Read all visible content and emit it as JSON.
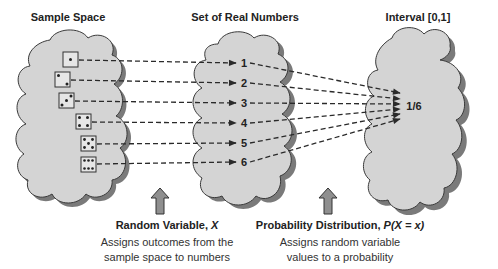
{
  "titles": {
    "sample_space": "Sample Space",
    "real_numbers": "Set of Real Numbers",
    "interval": "Interval [0,1]"
  },
  "sample_space": {
    "outcomes": [
      {
        "die_face": 1
      },
      {
        "die_face": 2
      },
      {
        "die_face": 3
      },
      {
        "die_face": 4
      },
      {
        "die_face": 5
      },
      {
        "die_face": 6
      }
    ]
  },
  "real_numbers": {
    "values": [
      "1",
      "2",
      "3",
      "4",
      "5",
      "6"
    ]
  },
  "interval": {
    "probability": "1/6"
  },
  "captions": {
    "random_variable": {
      "heading_prefix": "Random Variable, ",
      "heading_symbol": "X",
      "line1": "Assigns outcomes from the",
      "line2": "sample space to numbers"
    },
    "probability_distribution": {
      "heading_prefix": "Probability Distribution, ",
      "heading_symbol": "P(X = x)",
      "line1": "Assigns random variable",
      "line2": "values to a probability"
    }
  },
  "colors": {
    "cloud_fill": "#d4d4d4",
    "cloud_shadow": "#7a7a7a",
    "outline": "#3a3a3a",
    "arrow_fill": "#8f8f8f",
    "text": "#222222"
  }
}
